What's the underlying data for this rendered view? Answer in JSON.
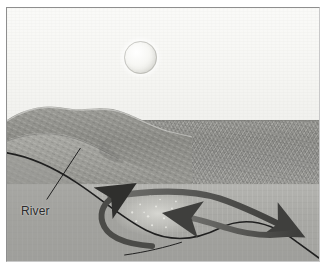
{
  "figure": {
    "name": "coastal-upwelling-nutrient-diagram",
    "labels": {
      "river": "River",
      "nutrients_line1": "Nutrients",
      "nutrients_line2": "accumulating"
    },
    "elements": {
      "sun": "sun-disc",
      "sky": "sky",
      "headland": "coastal-headland",
      "sea_surface_band": "distant-sea-surface",
      "water_body": "foreground-water",
      "seabed": "seabed-profile",
      "nutrient_patch": "nutrient-speckle-patch"
    },
    "arrows": [
      {
        "name": "surface-current-arrow",
        "direction": "right-down",
        "label": ""
      },
      {
        "name": "return-current-arrow",
        "direction": "left",
        "label": ""
      },
      {
        "name": "upwelling-arrow",
        "direction": "up-right",
        "label": ""
      }
    ],
    "colors": {
      "sky": "#f6f6f3",
      "sun": "#f1f1ec",
      "land": "#8d8d88",
      "sea_band": "#939390",
      "water": "#aaaaa6",
      "line": "#232323",
      "arrow": "#4a4a48",
      "frame": "#8e8e8e"
    }
  }
}
